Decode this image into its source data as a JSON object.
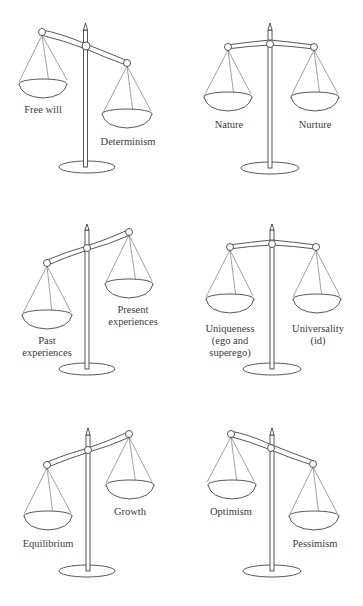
{
  "diagram": {
    "type": "balance-scales",
    "layout": "3 rows x 2 columns",
    "scales": [
      {
        "id": "free-will-determinism",
        "tilt": "left-high",
        "left_label": "Free will",
        "right_label": "Determinism"
      },
      {
        "id": "nature-nurture",
        "tilt": "balanced",
        "left_label": "Nature",
        "right_label": "Nurture"
      },
      {
        "id": "past-present",
        "tilt": "left-low",
        "left_label": "Past experiences",
        "right_label": "Present experiences"
      },
      {
        "id": "uniqueness-universality",
        "tilt": "balanced",
        "left_label": "Uniqueness (ego and superego)",
        "right_label": "Universality (id)"
      },
      {
        "id": "equilibrium-growth",
        "tilt": "left-low",
        "left_label": "Equilibrium",
        "right_label": "Growth"
      },
      {
        "id": "optimism-pessimism",
        "tilt": "left-high",
        "left_label": "Optimism",
        "right_label": "Pessimism"
      }
    ]
  },
  "labels": {
    "s1": {
      "left": "Free will",
      "right": "Determinism"
    },
    "s2": {
      "left": "Nature",
      "right": "Nurture"
    },
    "s3": {
      "left1": "Past",
      "left2": "experiences",
      "right1": "Present",
      "right2": "experiences"
    },
    "s4": {
      "left1": "Uniqueness",
      "left2": "(ego and",
      "left3": "superego)",
      "right1": "Universality",
      "right2": "(id)"
    },
    "s5": {
      "left": "Equilibrium",
      "right": "Growth"
    },
    "s6": {
      "left": "Optimism",
      "right": "Pessimism"
    }
  }
}
